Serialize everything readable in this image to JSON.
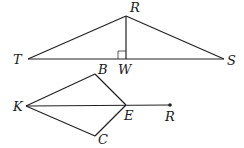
{
  "figure1": {
    "labels": {
      "R": "R",
      "T": "T",
      "W": "W",
      "S": "S"
    },
    "points": {
      "R": [
        126,
        16
      ],
      "T": [
        28,
        59
      ],
      "W": [
        126,
        59
      ],
      "S": [
        224,
        59
      ]
    },
    "right_angle_at": "W"
  },
  "figure2": {
    "labels": {
      "K": "K",
      "B": "B",
      "E": "E",
      "C": "C",
      "R": "R"
    },
    "points": {
      "K": [
        26,
        106
      ],
      "B": [
        95,
        74
      ],
      "E": [
        126,
        105
      ],
      "C": [
        95,
        136
      ],
      "R": [
        170,
        105
      ]
    }
  },
  "colors": {
    "stroke": "#222222",
    "background": "#ffffff"
  }
}
